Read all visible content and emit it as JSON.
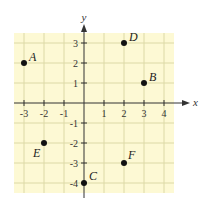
{
  "diagram": {
    "type": "coordinate-plane",
    "background_color": "#fdf9d4",
    "grid_color": "#d8d6a8",
    "axis_color": "#333333",
    "axes": {
      "x_label": "x",
      "y_label": "y",
      "x_range": [
        -3.5,
        4.5
      ],
      "y_range": [
        -4.5,
        3.5
      ],
      "x_ticks": [
        "-3",
        "-2",
        "-1",
        "1",
        "2",
        "3",
        "4"
      ],
      "y_ticks": [
        "3",
        "2",
        "1",
        "-1",
        "-2",
        "-3",
        "-4"
      ]
    },
    "points": [
      {
        "label": "A",
        "x": -3,
        "y": 2
      },
      {
        "label": "B",
        "x": 3,
        "y": 1
      },
      {
        "label": "C",
        "x": 0,
        "y": -4
      },
      {
        "label": "D",
        "x": 2,
        "y": 3
      },
      {
        "label": "E",
        "x": -2,
        "y": -2
      },
      {
        "label": "F",
        "x": 2,
        "y": -3
      }
    ]
  }
}
